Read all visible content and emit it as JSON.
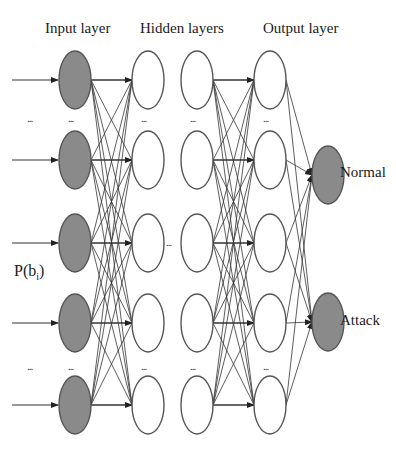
{
  "diagram": {
    "type": "neural-network",
    "layer_titles": {
      "input": "Input layer",
      "hidden": "Hidden layers",
      "output": "Output layer"
    },
    "input_label": "P(b",
    "input_label_sub": "i",
    "input_label_close": ")",
    "outputs": [
      "Normal",
      "Attack"
    ],
    "ellipsis": "...",
    "colors": {
      "input_fill": "#8a8a8a",
      "output_fill": "#8a8a8a",
      "hidden_fill": "#ffffff",
      "stroke": "#555555",
      "edge": "#333333"
    },
    "layers": {
      "input": {
        "x": 75,
        "nodes": [
          80,
          160,
          243,
          323,
          405
        ],
        "filled": true
      },
      "hidden1": {
        "x": 148,
        "nodes": [
          80,
          160,
          243,
          323,
          405
        ],
        "filled": false
      },
      "hidden2": {
        "x": 197,
        "nodes": [
          80,
          160,
          243,
          323,
          405
        ],
        "filled": false
      },
      "output": {
        "x": 270,
        "nodes": [
          80,
          160,
          243,
          323,
          405
        ],
        "filled": false
      },
      "final": {
        "x": 328,
        "nodes": [
          175,
          322
        ],
        "filled": true
      }
    }
  }
}
